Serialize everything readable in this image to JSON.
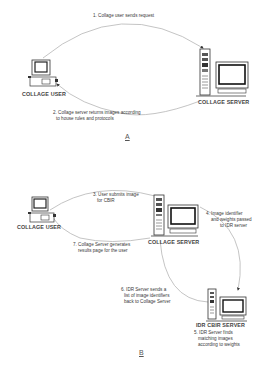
{
  "diagram_a": {
    "section_label": "A",
    "nodes": {
      "user": {
        "label": "COLLAGE USER"
      },
      "server": {
        "label": "COLLAGE SERVER"
      }
    },
    "steps": [
      {
        "text": "1. Collage user sends request"
      },
      {
        "line1": "2. Collage server returns images according",
        "line2": "to house rules and protocols"
      }
    ]
  },
  "diagram_b": {
    "section_label": "B",
    "nodes": {
      "user": {
        "label": "COLLAGE USER"
      },
      "server": {
        "label": "COLLAGE SERVER"
      },
      "idr": {
        "label": "IDR CBIR SERVER"
      }
    },
    "steps": {
      "s3": {
        "line1": "3. User submits image",
        "line2": "for CBIR"
      },
      "s4": {
        "line1": "4. Image identifier",
        "line2": "and weights passed",
        "line3": "to IDR server"
      },
      "s5": {
        "line1": "5. IDR Server finds",
        "line2": "matching images",
        "line3": "according to weights"
      },
      "s6": {
        "line1": "6. IDR Server sends a",
        "line2": "list of image identifiers",
        "line3": "back to Collage Server"
      },
      "s7": {
        "line1": "7. Collage Server generates",
        "line2": "results page for the user"
      }
    }
  },
  "colors": {
    "line": "#aaaaaa",
    "ink": "#333333",
    "screen": "#222222"
  }
}
